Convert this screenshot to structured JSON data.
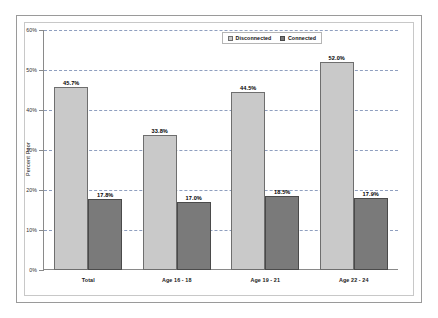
{
  "chart_data": {
    "type": "bar",
    "title": "",
    "xlabel": "",
    "ylabel": "Percent Poor",
    "ylim": [
      0,
      60
    ],
    "ytick_labels": [
      "0%",
      "10%",
      "20%",
      "30%",
      "40%",
      "50%",
      "60%"
    ],
    "ytick_values": [
      0,
      10,
      20,
      30,
      40,
      50,
      60
    ],
    "grid": true,
    "legend_position": "top-right-inside",
    "categories": [
      "Total",
      "Age 16 - 18",
      "Age 19 - 21",
      "Age 22 - 24"
    ],
    "series": [
      {
        "name": "Disconnected",
        "color": "#c9c9c9",
        "values": [
          45.7,
          33.8,
          44.5,
          52.0
        ],
        "labels": [
          "45.7%",
          "33.8%",
          "44.5%",
          "52.0%"
        ]
      },
      {
        "name": "Connected",
        "color": "#7a7a7a",
        "values": [
          17.8,
          17.0,
          18.5,
          17.9
        ],
        "labels": [
          "17.8%",
          "17.0%",
          "18.5%",
          "17.9%"
        ]
      }
    ]
  },
  "legend": {
    "items": [
      {
        "label": "Disconnected",
        "swatch": "disconnected"
      },
      {
        "label": "Connected",
        "swatch": "connected"
      }
    ]
  }
}
